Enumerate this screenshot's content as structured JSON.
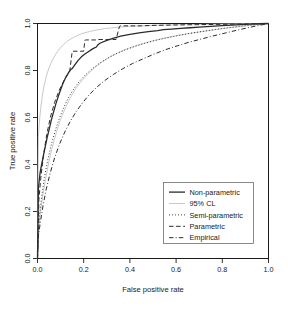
{
  "chart_data": {
    "type": "line",
    "title": "",
    "xlabel": "False positive rate",
    "ylabel": "True positive rate",
    "xlim": [
      0,
      1
    ],
    "ylim": [
      0,
      1
    ],
    "grid": false,
    "legend_position": "bottom-right",
    "xticks": [
      "0.0",
      "0.2",
      "0.4",
      "0.6",
      "0.8",
      "1.0"
    ],
    "xtick_values": [
      0.0,
      0.2,
      0.4,
      0.6,
      0.8,
      1.0
    ],
    "yticks": [
      "0.0",
      "0.2",
      "0.4",
      "0.6",
      "0.8",
      "1.0"
    ],
    "ytick_values": [
      0.0,
      0.2,
      0.4,
      0.6,
      0.8,
      1.0
    ],
    "series": [
      {
        "name": "Non-parametric",
        "style": "solid",
        "color": "#2b2b2b",
        "width": 1.3,
        "x": [
          0.0,
          0.004,
          0.01,
          0.012,
          0.018,
          0.026,
          0.034,
          0.042,
          0.052,
          0.06,
          0.07,
          0.08,
          0.09,
          0.1,
          0.11,
          0.122,
          0.134,
          0.145,
          0.15,
          0.16,
          0.175,
          0.19,
          0.205,
          0.22,
          0.24,
          0.255,
          0.262,
          0.27,
          0.3,
          0.33,
          0.36,
          0.4,
          0.44,
          0.48,
          0.52,
          0.545,
          0.58,
          0.62,
          0.66,
          0.7,
          0.75,
          0.8,
          0.86,
          0.92,
          0.96,
          1.0
        ],
        "y": [
          0.0,
          0.3,
          0.355,
          0.37,
          0.4,
          0.44,
          0.478,
          0.515,
          0.556,
          0.59,
          0.625,
          0.66,
          0.69,
          0.718,
          0.745,
          0.77,
          0.79,
          0.806,
          0.808,
          0.822,
          0.842,
          0.858,
          0.87,
          0.88,
          0.893,
          0.9,
          0.91,
          0.916,
          0.928,
          0.938,
          0.946,
          0.954,
          0.96,
          0.965,
          0.97,
          0.974,
          0.976,
          0.979,
          0.982,
          0.985,
          0.988,
          0.991,
          0.994,
          0.997,
          0.999,
          1.0
        ]
      },
      {
        "name": "95% CL",
        "style": "solid",
        "color": "#c9c9c9",
        "width": 1.0,
        "bands": [
          {
            "label": "upper",
            "x": [
              0.0,
              0.004,
              0.008,
              0.014,
              0.022,
              0.03,
              0.04,
              0.05,
              0.062,
              0.074,
              0.086,
              0.098,
              0.112,
              0.126,
              0.14,
              0.155,
              0.17,
              0.19,
              0.21,
              0.235,
              0.26,
              0.29,
              0.32,
              0.36,
              0.4,
              0.45,
              0.5,
              0.56,
              0.62,
              0.7,
              0.78,
              0.86,
              0.93,
              1.0
            ],
            "y": [
              0.0,
              0.52,
              0.58,
              0.64,
              0.7,
              0.742,
              0.782,
              0.812,
              0.84,
              0.862,
              0.88,
              0.895,
              0.91,
              0.922,
              0.932,
              0.94,
              0.948,
              0.956,
              0.962,
              0.968,
              0.973,
              0.978,
              0.981,
              0.985,
              0.988,
              0.99,
              0.992,
              0.994,
              0.995,
              0.996,
              0.997,
              0.998,
              0.999,
              1.0
            ]
          },
          {
            "label": "lower",
            "x": [
              0.0,
              0.006,
              0.014,
              0.024,
              0.036,
              0.05,
              0.065,
              0.082,
              0.1,
              0.12,
              0.142,
              0.165,
              0.19,
              0.215,
              0.245,
              0.275,
              0.31,
              0.35,
              0.39,
              0.44,
              0.49,
              0.545,
              0.6,
              0.66,
              0.72,
              0.79,
              0.86,
              0.93,
              1.0
            ],
            "y": [
              0.0,
              0.14,
              0.205,
              0.275,
              0.345,
              0.415,
              0.478,
              0.538,
              0.592,
              0.64,
              0.684,
              0.722,
              0.755,
              0.782,
              0.81,
              0.833,
              0.856,
              0.876,
              0.893,
              0.91,
              0.924,
              0.937,
              0.948,
              0.958,
              0.967,
              0.977,
              0.985,
              0.993,
              1.0
            ]
          }
        ]
      },
      {
        "name": "Semi-parametric",
        "style": "dotted",
        "color": "#2b2b2b",
        "width": 1.0,
        "x": [
          0.0,
          0.008,
          0.018,
          0.03,
          0.044,
          0.06,
          0.078,
          0.096,
          0.116,
          0.138,
          0.16,
          0.185,
          0.21,
          0.24,
          0.27,
          0.305,
          0.34,
          0.38,
          0.42,
          0.465,
          0.51,
          0.56,
          0.61,
          0.665,
          0.72,
          0.78,
          0.84,
          0.9,
          0.95,
          1.0
        ],
        "y": [
          0.0,
          0.18,
          0.262,
          0.345,
          0.418,
          0.486,
          0.548,
          0.6,
          0.648,
          0.692,
          0.726,
          0.758,
          0.784,
          0.81,
          0.832,
          0.853,
          0.871,
          0.888,
          0.902,
          0.916,
          0.928,
          0.939,
          0.949,
          0.959,
          0.967,
          0.976,
          0.984,
          0.991,
          0.996,
          1.0
        ]
      },
      {
        "name": "Parametric",
        "style": "dashed",
        "color": "#2b2b2b",
        "width": 1.0,
        "x": [
          0.0,
          0.006,
          0.014,
          0.026,
          0.04,
          0.056,
          0.074,
          0.094,
          0.116,
          0.14,
          0.15,
          0.152,
          0.2,
          0.205,
          0.207,
          0.25,
          0.26,
          0.262,
          0.3,
          0.34,
          0.355,
          0.358,
          0.4,
          0.45,
          0.5,
          0.56,
          0.62,
          0.69,
          0.76,
          0.83,
          0.9,
          0.96,
          1.0
        ],
        "y": [
          0.0,
          0.25,
          0.34,
          0.44,
          0.528,
          0.602,
          0.664,
          0.716,
          0.76,
          0.8,
          0.88,
          0.882,
          0.882,
          0.928,
          0.93,
          0.93,
          0.93,
          0.932,
          0.932,
          0.932,
          0.988,
          0.99,
          0.99,
          0.99,
          0.992,
          0.993,
          0.994,
          0.995,
          0.996,
          0.997,
          0.998,
          0.999,
          1.0
        ]
      },
      {
        "name": "Empirical",
        "style": "dashdot",
        "color": "#2b2b2b",
        "width": 1.0,
        "x": [
          0.0,
          0.004,
          0.012,
          0.024,
          0.038,
          0.055,
          0.074,
          0.095,
          0.118,
          0.142,
          0.168,
          0.196,
          0.225,
          0.258,
          0.292,
          0.33,
          0.37,
          0.412,
          0.458,
          0.505,
          0.555,
          0.605,
          0.655,
          0.705,
          0.76,
          0.815,
          0.87,
          0.925,
          0.965,
          1.0
        ],
        "y": [
          0.0,
          0.095,
          0.152,
          0.225,
          0.296,
          0.364,
          0.428,
          0.486,
          0.538,
          0.584,
          0.626,
          0.664,
          0.698,
          0.73,
          0.758,
          0.784,
          0.808,
          0.83,
          0.85,
          0.87,
          0.889,
          0.905,
          0.92,
          0.933,
          0.947,
          0.96,
          0.973,
          0.985,
          0.993,
          1.0
        ]
      }
    ],
    "legend_entries": [
      {
        "label": "Non-parametric",
        "style": "solid",
        "color": "#2b2b2b"
      },
      {
        "label": "95% CL",
        "style": "solid",
        "color": "#c9c9c9"
      },
      {
        "label": "Semi-parametric",
        "style": "dotted",
        "color": "#2b2b2b"
      },
      {
        "label": "Parametric",
        "style": "dashed",
        "color": "#2b2b2b"
      },
      {
        "label": "Empirical",
        "style": "dashdot",
        "color": "#2b2b2b"
      }
    ]
  }
}
